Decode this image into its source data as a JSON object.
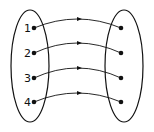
{
  "diagram": {
    "type": "mapping",
    "domain_set": {
      "ellipse": {
        "cx": 30,
        "cy": 66,
        "rx": 19,
        "ry": 56
      },
      "elements": [
        {
          "label": "1",
          "x": 34,
          "y": 28
        },
        {
          "label": "2",
          "x": 34,
          "y": 53
        },
        {
          "label": "3",
          "x": 34,
          "y": 78
        },
        {
          "label": "4",
          "x": 34,
          "y": 102
        }
      ]
    },
    "codomain_set": {
      "ellipse": {
        "cx": 124,
        "cy": 66,
        "rx": 19,
        "ry": 56
      },
      "elements": [
        {
          "label": "",
          "x": 121,
          "y": 28
        },
        {
          "label": "",
          "x": 121,
          "y": 53
        },
        {
          "label": "",
          "x": 121,
          "y": 78
        },
        {
          "label": "",
          "x": 121,
          "y": 102
        }
      ]
    },
    "arrows": [
      {
        "from": 0,
        "to": 0,
        "peak_y": 19
      },
      {
        "from": 1,
        "to": 1,
        "peak_y": 43
      },
      {
        "from": 2,
        "to": 2,
        "peak_y": 68
      },
      {
        "from": 3,
        "to": 3,
        "peak_y": 93
      }
    ],
    "stroke_color": "#111111"
  }
}
